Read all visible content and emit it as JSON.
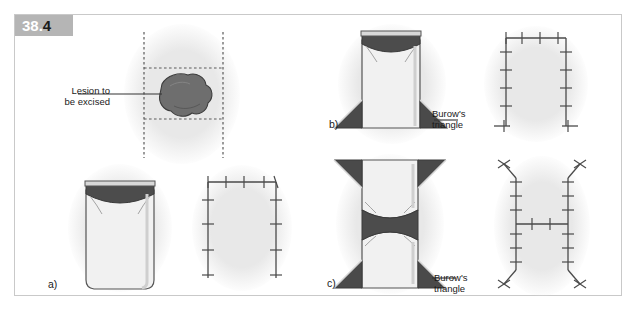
{
  "figure": {
    "badge_number": "38",
    "badge_separator": ".",
    "badge_sub": "4",
    "frame_color": "#c9c9c9",
    "badge_color": "#b5b5b5",
    "background": "#ffffff"
  },
  "colors": {
    "skin_oval": "#e8e8e8",
    "flap_fill": "#f1f1f1",
    "defect_dark": "#4c4c4c",
    "lesion_fill": "#6e6e6e",
    "lesion_stroke": "#3c3c3c",
    "line_stroke": "#555555",
    "suture_stroke": "#4a4a4a",
    "dashed_stroke": "#5a5a5a",
    "burow_fill": "#4a4a4a",
    "text": "#1a1a1a"
  },
  "panels": [
    {
      "id": "lesion-planning",
      "caption": "",
      "description": "Oval skin area with dashed rectangular excision plan and lesion"
    },
    {
      "id": "panel-a-flap",
      "caption": "a)",
      "description": "Single advancement flap raised with dark defect at superior margin"
    },
    {
      "id": "panel-a-result",
      "caption": "",
      "description": "Sutured single advancement flap, U-shaped suture line"
    },
    {
      "id": "panel-b-flap",
      "caption": "b)",
      "description": "Advancement flap with two inferior Burow's triangles"
    },
    {
      "id": "panel-b-result",
      "caption": "",
      "description": "Sutured advancement flap with Burow's triangle closures"
    },
    {
      "id": "panel-c-flap",
      "caption": "c)",
      "description": "Double advancement (H-plasty) flap with four Burow's triangles"
    },
    {
      "id": "panel-c-result",
      "caption": "",
      "description": "Sutured H-plasty, H-shaped suture line"
    }
  ],
  "annotations": {
    "lesion": {
      "line1": "Lesion to",
      "line2": "be excised"
    },
    "burow_b": {
      "line1": "Burow's",
      "line2": "triangle"
    },
    "burow_c": {
      "line1": "Burow's",
      "line2": "triangle"
    }
  },
  "captions": {
    "a": "a)",
    "b": "b)",
    "c": "c)"
  }
}
